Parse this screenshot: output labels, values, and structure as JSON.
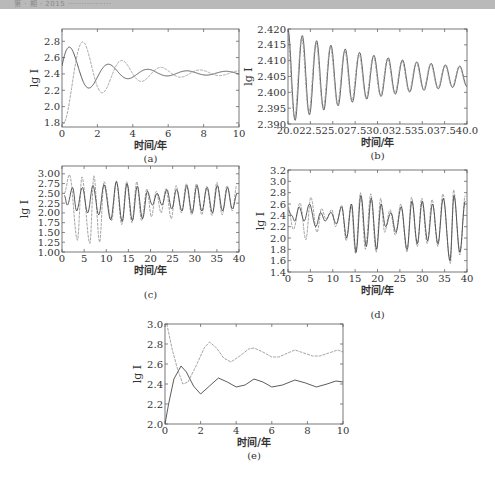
{
  "page": {
    "header_text": "第 · 期 · 2015 ················"
  },
  "chart_data": [
    {
      "id": "a",
      "type": "line",
      "tag": "(a)",
      "xlabel": "时间/年",
      "ylabel": "lg I",
      "xlim": [
        0,
        10
      ],
      "ylim": [
        1.75,
        2.95
      ],
      "xticks": [
        0,
        2,
        4,
        6,
        8,
        10
      ],
      "xtick_labels": [
        "0",
        "2",
        "4",
        "6",
        "8",
        "10"
      ],
      "yticks": [
        1.8,
        2.0,
        2.2,
        2.4,
        2.6,
        2.8
      ],
      "ytick_labels": [
        "1.8",
        "2.0",
        "2.2",
        "2.4",
        "2.6",
        "2.8"
      ],
      "frame": {
        "x0": 62,
        "x1": 239,
        "y_top": 29,
        "y_bottom": 127
      },
      "series": [
        {
          "name": "solid",
          "style": "dark",
          "model": {
            "base": 2.41,
            "amp": 0.38,
            "decay": 0.55,
            "period": 2.2,
            "phase": -1.35,
            "tmax": 10,
            "floor_amp": 0.02
          }
        },
        {
          "name": "dashed",
          "style": "light",
          "model": {
            "base": 2.41,
            "amp": -0.62,
            "decay": 0.45,
            "period": 2.2,
            "phase": -0.35,
            "tmax": 10,
            "floor_amp": 0.02
          }
        }
      ]
    },
    {
      "id": "b",
      "type": "line",
      "tag": "(b)",
      "xlabel": "时间/年",
      "ylabel": "lg I",
      "xlim": [
        20,
        40
      ],
      "ylim": [
        2.39,
        2.42
      ],
      "xticks": [
        20,
        22.5,
        25,
        27.5,
        30,
        32.5,
        35,
        37.5,
        40
      ],
      "xtick_labels": [
        "20.0",
        "22.5",
        "25.0",
        "27.5",
        "30.0",
        "32.5",
        "35.0",
        "37.5",
        "40.0"
      ],
      "yticks": [
        2.39,
        2.395,
        2.4,
        2.405,
        2.41,
        2.415,
        2.42
      ],
      "ytick_labels": [
        "2.390",
        "2.395",
        "2.400",
        "2.405",
        "2.410",
        "2.415",
        "2.420"
      ],
      "frame": {
        "x0": 288,
        "x1": 467,
        "y_top": 29,
        "y_bottom": 124
      },
      "series": [
        {
          "name": "solid",
          "style": "dark",
          "model": {
            "t0": 20,
            "base": 2.405,
            "amp": 0.014,
            "decay": 0.09,
            "period": 1.6,
            "phase": 0.0,
            "tmax": 40,
            "floor_amp": 0.0008
          }
        },
        {
          "name": "dashed",
          "style": "light",
          "model": {
            "t0": 20,
            "base": 2.405,
            "amp": 0.013,
            "decay": 0.09,
            "period": 1.6,
            "phase": 0.25,
            "tmax": 40,
            "floor_amp": 0.0008
          }
        }
      ]
    },
    {
      "id": "c",
      "type": "line",
      "tag": "(c)",
      "xlabel": "时间/年",
      "ylabel": "lg I",
      "xlim": [
        0,
        40
      ],
      "ylim": [
        1.0,
        3.2
      ],
      "xticks": [
        0,
        5,
        10,
        15,
        20,
        25,
        30,
        35,
        40
      ],
      "xtick_labels": [
        "0",
        "5",
        "10",
        "15",
        "20",
        "25",
        "30",
        "35",
        "40"
      ],
      "yticks": [
        1.0,
        1.25,
        1.5,
        1.75,
        2.0,
        2.25,
        2.5,
        2.75,
        3.0
      ],
      "ytick_labels": [
        "1.00",
        "1.25",
        "1.50",
        "1.75",
        "2.00",
        "2.25",
        "2.50",
        "2.75",
        "3.00"
      ],
      "frame": {
        "x0": 62,
        "x1": 239,
        "y_top": 166,
        "y_bottom": 252
      },
      "peaks_light": [
        [
          0.5,
          2.5
        ],
        [
          1.7,
          2.98
        ],
        [
          3.5,
          1.3
        ],
        [
          4.5,
          2.92
        ],
        [
          6.3,
          1.22
        ],
        [
          7.2,
          2.95
        ],
        [
          8.5,
          1.25
        ],
        [
          9.5,
          2.8
        ],
        [
          11.2,
          1.8
        ],
        [
          12.3,
          2.82
        ],
        [
          13.5,
          1.7
        ],
        [
          14.6,
          2.8
        ],
        [
          15.8,
          1.75
        ],
        [
          16.9,
          2.8
        ],
        [
          18,
          1.8
        ],
        [
          19.2,
          2.62
        ],
        [
          20.2,
          1.9
        ],
        [
          21.3,
          2.55
        ],
        [
          22.4,
          2.0
        ],
        [
          23.5,
          2.62
        ],
        [
          24.7,
          1.85
        ],
        [
          25.8,
          2.7
        ],
        [
          27,
          2.0
        ],
        [
          28.1,
          2.75
        ],
        [
          29.3,
          1.95
        ],
        [
          30.4,
          2.75
        ],
        [
          31.6,
          1.95
        ],
        [
          32.7,
          2.68
        ],
        [
          33.9,
          1.93
        ],
        [
          35,
          2.78
        ],
        [
          36.2,
          1.95
        ],
        [
          37.3,
          2.7
        ],
        [
          38.5,
          2.05
        ],
        [
          39.5,
          2.7
        ]
      ],
      "peaks_dark": [
        [
          0.5,
          2.45
        ],
        [
          1.2,
          2.2
        ],
        [
          2.4,
          2.65
        ],
        [
          3.3,
          2.05
        ],
        [
          4.6,
          2.65
        ],
        [
          5.8,
          2.0
        ],
        [
          7.0,
          2.7
        ],
        [
          8.3,
          1.95
        ],
        [
          9.5,
          2.72
        ],
        [
          11.0,
          1.82
        ],
        [
          12.3,
          2.8
        ],
        [
          13.6,
          1.78
        ],
        [
          14.7,
          2.75
        ],
        [
          15.9,
          1.8
        ],
        [
          17,
          2.68
        ],
        [
          18.2,
          1.85
        ],
        [
          19.3,
          2.55
        ],
        [
          20.4,
          2.2
        ],
        [
          21.5,
          2.5
        ],
        [
          22.6,
          2.2
        ],
        [
          23.7,
          2.6
        ],
        [
          24.8,
          2.1
        ],
        [
          25.9,
          2.6
        ],
        [
          27.1,
          2.05
        ],
        [
          28.2,
          2.7
        ],
        [
          29.4,
          2.0
        ],
        [
          30.5,
          2.7
        ],
        [
          31.6,
          2.05
        ],
        [
          32.8,
          2.65
        ],
        [
          34,
          2.0
        ],
        [
          35.1,
          2.7
        ],
        [
          36.3,
          2.05
        ],
        [
          37.4,
          2.65
        ],
        [
          38.5,
          2.1
        ],
        [
          39.6,
          2.5
        ]
      ]
    },
    {
      "id": "d",
      "type": "line",
      "tag": "(d)",
      "xlabel": "时间/年",
      "ylabel": "lg I",
      "xlim": [
        0,
        40
      ],
      "ylim": [
        1.4,
        3.2
      ],
      "xticks": [
        0,
        5,
        10,
        15,
        20,
        25,
        30,
        35,
        40
      ],
      "xtick_labels": [
        "0",
        "5",
        "10",
        "15",
        "20",
        "25",
        "30",
        "35",
        "40"
      ],
      "yticks": [
        1.4,
        1.6,
        1.8,
        2.0,
        2.2,
        2.4,
        2.6,
        2.8,
        3.0,
        3.2
      ],
      "ytick_labels": [
        "1.4",
        "1.6",
        "1.8",
        "2.0",
        "2.2",
        "2.4",
        "2.6",
        "2.8",
        "3.0",
        "3.2"
      ],
      "frame": {
        "x0": 288,
        "x1": 467,
        "y_top": 170,
        "y_bottom": 272
      },
      "peaks_light": [
        [
          0,
          2.55
        ],
        [
          1.2,
          2.15
        ],
        [
          2.7,
          2.62
        ],
        [
          4,
          1.97
        ],
        [
          5.1,
          2.72
        ],
        [
          6.5,
          2.1
        ],
        [
          7.5,
          2.52
        ],
        [
          8.5,
          2.33
        ],
        [
          9.8,
          2.5
        ],
        [
          10.6,
          2.2
        ],
        [
          12,
          2.58
        ],
        [
          13,
          1.95
        ],
        [
          14.1,
          2.6
        ],
        [
          15.1,
          1.72
        ],
        [
          16.2,
          2.8
        ],
        [
          17.3,
          1.8
        ],
        [
          18.5,
          2.78
        ],
        [
          19.7,
          1.75
        ],
        [
          20.7,
          2.7
        ],
        [
          21.6,
          2.1
        ],
        [
          22.8,
          2.5
        ],
        [
          24,
          2.05
        ],
        [
          25.2,
          2.6
        ],
        [
          26.6,
          1.75
        ],
        [
          27.6,
          2.72
        ],
        [
          28.9,
          1.85
        ],
        [
          29.9,
          2.7
        ],
        [
          31.1,
          1.9
        ],
        [
          32.2,
          2.68
        ],
        [
          33.5,
          1.85
        ],
        [
          34.6,
          2.78
        ],
        [
          36.3,
          1.55
        ],
        [
          37,
          2.85
        ],
        [
          38.4,
          1.7
        ],
        [
          39.6,
          2.75
        ]
      ],
      "peaks_dark": [
        [
          0,
          2.5
        ],
        [
          0.8,
          2.4
        ],
        [
          1.5,
          2.3
        ],
        [
          2.5,
          2.55
        ],
        [
          3.6,
          2.3
        ],
        [
          4.8,
          2.6
        ],
        [
          6.2,
          2.2
        ],
        [
          7.3,
          2.45
        ],
        [
          8.3,
          2.3
        ],
        [
          9.6,
          2.45
        ],
        [
          10.8,
          2.25
        ],
        [
          12,
          2.55
        ],
        [
          13.1,
          2.0
        ],
        [
          14.2,
          2.6
        ],
        [
          15.2,
          1.75
        ],
        [
          16.3,
          2.75
        ],
        [
          17.5,
          1.85
        ],
        [
          18.6,
          2.7
        ],
        [
          19.8,
          1.8
        ],
        [
          20.8,
          2.6
        ],
        [
          21.8,
          2.2
        ],
        [
          23,
          2.45
        ],
        [
          24.1,
          2.1
        ],
        [
          25.3,
          2.55
        ],
        [
          26.6,
          1.8
        ],
        [
          27.7,
          2.65
        ],
        [
          28.9,
          1.9
        ],
        [
          30,
          2.65
        ],
        [
          31.2,
          1.95
        ],
        [
          32.3,
          2.6
        ],
        [
          33.5,
          1.9
        ],
        [
          34.7,
          2.7
        ],
        [
          36.2,
          1.6
        ],
        [
          37.1,
          2.75
        ],
        [
          38.4,
          1.75
        ],
        [
          39.6,
          2.65
        ]
      ]
    },
    {
      "id": "e",
      "type": "line",
      "tag": "(e)",
      "xlabel": "时间/年",
      "ylabel": "lg I",
      "xlim": [
        0,
        10
      ],
      "ylim": [
        2.0,
        3.0
      ],
      "xticks": [
        0,
        2,
        4,
        6,
        8,
        10
      ],
      "xtick_labels": [
        "0",
        "2",
        "4",
        "6",
        "8",
        "10"
      ],
      "yticks": [
        2.0,
        2.2,
        2.4,
        2.6,
        2.8,
        3.0
      ],
      "ytick_labels": [
        "2.0",
        "2.2",
        "2.4",
        "2.6",
        "2.8",
        "3.0"
      ],
      "frame": {
        "x0": 165,
        "x1": 343,
        "y_top": 324,
        "y_bottom": 424
      },
      "series": [
        {
          "name": "lower (solid)",
          "style": "dark",
          "points": [
            [
              0,
              2.0
            ],
            [
              0.2,
              2.2
            ],
            [
              0.5,
              2.45
            ],
            [
              0.9,
              2.58
            ],
            [
              1.2,
              2.52
            ],
            [
              1.6,
              2.38
            ],
            [
              2.0,
              2.3
            ],
            [
              2.5,
              2.38
            ],
            [
              3.0,
              2.46
            ],
            [
              3.5,
              2.42
            ],
            [
              4.0,
              2.37
            ],
            [
              4.5,
              2.39
            ],
            [
              5.0,
              2.45
            ],
            [
              5.5,
              2.42
            ],
            [
              6.0,
              2.37
            ],
            [
              6.6,
              2.39
            ],
            [
              7.3,
              2.44
            ],
            [
              7.9,
              2.41
            ],
            [
              8.5,
              2.37
            ],
            [
              9.1,
              2.4
            ],
            [
              9.6,
              2.43
            ],
            [
              10,
              2.42
            ]
          ]
        },
        {
          "name": "upper (dashed)",
          "style": "light",
          "points": [
            [
              0.1,
              3.0
            ],
            [
              0.4,
              2.75
            ],
            [
              0.7,
              2.55
            ],
            [
              1.0,
              2.4
            ],
            [
              1.3,
              2.42
            ],
            [
              1.8,
              2.6
            ],
            [
              2.2,
              2.76
            ],
            [
              2.5,
              2.82
            ],
            [
              2.9,
              2.76
            ],
            [
              3.3,
              2.66
            ],
            [
              3.7,
              2.62
            ],
            [
              4.2,
              2.68
            ],
            [
              4.7,
              2.75
            ],
            [
              5.0,
              2.76
            ],
            [
              5.5,
              2.72
            ],
            [
              6.0,
              2.67
            ],
            [
              6.4,
              2.67
            ],
            [
              6.9,
              2.71
            ],
            [
              7.3,
              2.74
            ],
            [
              7.8,
              2.71
            ],
            [
              8.3,
              2.68
            ],
            [
              8.7,
              2.68
            ],
            [
              9.2,
              2.71
            ],
            [
              9.7,
              2.74
            ],
            [
              10,
              2.72
            ]
          ]
        }
      ]
    }
  ]
}
